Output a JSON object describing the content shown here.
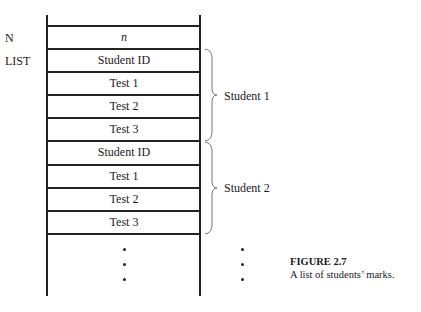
{
  "labels": {
    "n_label": "N",
    "list_label": "LIST"
  },
  "cells": [
    {
      "text": "n",
      "italic": true
    },
    {
      "text": "Student ID"
    },
    {
      "text": "Test 1"
    },
    {
      "text": "Test 2"
    },
    {
      "text": "Test 3"
    },
    {
      "text": "Student ID"
    },
    {
      "text": "Test 1"
    },
    {
      "text": "Test 2"
    },
    {
      "text": "Test 3"
    }
  ],
  "groups": [
    {
      "label": "Student 1"
    },
    {
      "label": "Student 2"
    }
  ],
  "continuation": "ellipsis-vertical",
  "caption": {
    "title": "FIGURE 2.7",
    "text": "A list of students’ marks."
  }
}
